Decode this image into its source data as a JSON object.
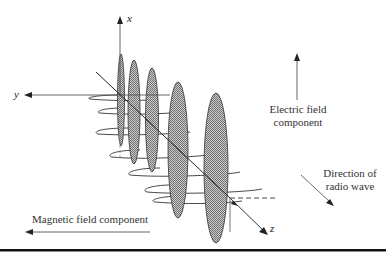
{
  "axes": {
    "x_label": "x",
    "y_label": "y",
    "z_label": "z"
  },
  "labels": {
    "electric_line1": "Electric field",
    "electric_line2": "component",
    "direction_line1": "Direction of",
    "direction_line2": "radio wave",
    "magnetic": "Magnetic field component"
  },
  "colors": {
    "line": "#333333",
    "axis_gray": "#777777",
    "fill_pattern": "#9a9a9a",
    "rule": "#111111"
  }
}
